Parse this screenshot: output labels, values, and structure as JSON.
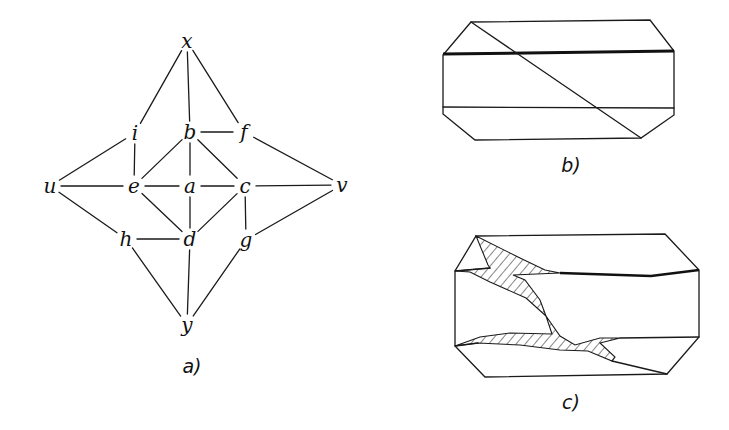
{
  "figure_a": {
    "caption": "a)",
    "nodes": [
      {
        "id": "x",
        "label": "x",
        "pos": [
          187,
          41
        ]
      },
      {
        "id": "i",
        "label": "i",
        "pos": [
          135,
          133
        ]
      },
      {
        "id": "b",
        "label": "b",
        "pos": [
          190,
          132
        ]
      },
      {
        "id": "f",
        "label": "f",
        "pos": [
          244,
          132
        ]
      },
      {
        "id": "u",
        "label": "u",
        "pos": [
          50,
          186
        ]
      },
      {
        "id": "e",
        "label": "e",
        "pos": [
          134,
          186
        ]
      },
      {
        "id": "a",
        "label": "a",
        "pos": [
          190,
          186
        ]
      },
      {
        "id": "c",
        "label": "c",
        "pos": [
          245,
          186
        ]
      },
      {
        "id": "v",
        "label": "v",
        "pos": [
          342,
          185
        ]
      },
      {
        "id": "h",
        "label": "h",
        "pos": [
          126,
          239
        ]
      },
      {
        "id": "d",
        "label": "d",
        "pos": [
          190,
          239
        ]
      },
      {
        "id": "g",
        "label": "g",
        "pos": [
          246,
          240
        ]
      },
      {
        "id": "y",
        "label": "y",
        "pos": [
          187,
          325
        ]
      }
    ],
    "edges": [
      [
        "x",
        "i"
      ],
      [
        "x",
        "b"
      ],
      [
        "x",
        "f"
      ],
      [
        "b",
        "f"
      ],
      [
        "i",
        "u"
      ],
      [
        "i",
        "e"
      ],
      [
        "f",
        "v"
      ],
      [
        "b",
        "e"
      ],
      [
        "b",
        "a"
      ],
      [
        "b",
        "c"
      ],
      [
        "u",
        "e"
      ],
      [
        "e",
        "a"
      ],
      [
        "a",
        "c"
      ],
      [
        "c",
        "v"
      ],
      [
        "u",
        "h"
      ],
      [
        "e",
        "d"
      ],
      [
        "a",
        "d"
      ],
      [
        "c",
        "d"
      ],
      [
        "c",
        "g"
      ],
      [
        "v",
        "g"
      ],
      [
        "h",
        "d"
      ],
      [
        "h",
        "y"
      ],
      [
        "d",
        "y"
      ],
      [
        "g",
        "y"
      ]
    ]
  },
  "figure_b": {
    "caption": "b)"
  },
  "figure_c": {
    "caption": "c)"
  }
}
